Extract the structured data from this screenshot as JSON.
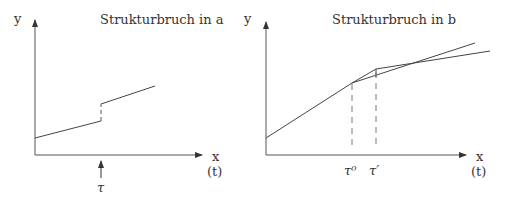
{
  "panels": [
    {
      "title": "Strukturbruch in a",
      "y_label": "y",
      "x_label": "x",
      "x_sublabel": "(t)",
      "break_label": "τ"
    },
    {
      "title": "Strukturbruch in b",
      "y_label": "y",
      "x_label": "x",
      "x_sublabel": "(t)",
      "break_labels": [
        "τ⁰",
        "τ′"
      ]
    }
  ],
  "colors": {
    "line": "#444444",
    "dash": "#777777",
    "text": "#333333"
  }
}
